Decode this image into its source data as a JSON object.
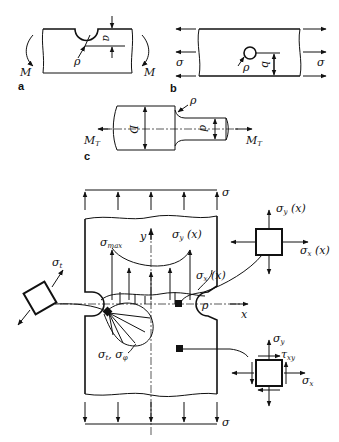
{
  "figure": {
    "panels": [
      {
        "id": "a",
        "label": "a",
        "symbols": {
          "moment_left": "M",
          "moment_right": "M",
          "radius": "ρ",
          "depth": "a"
        }
      },
      {
        "id": "b",
        "label": "b",
        "symbols": {
          "stress_left": "σ",
          "stress_right": "σ",
          "radius": "ρ",
          "distance": "b"
        }
      },
      {
        "id": "c",
        "label": "c",
        "symbols": {
          "torque_left": "M",
          "torque_left_sub": "T",
          "torque_right": "M",
          "torque_right_sub": "T",
          "radius": "ρ",
          "big_diameter": "D",
          "small_diameter": "d"
        }
      }
    ],
    "main": {
      "applied_stress_top": "σ",
      "applied_stress_bottom": "σ",
      "sigma_max": {
        "sym": "σ",
        "sub": "max"
      },
      "y_axis": "y",
      "x_axis": "x",
      "radius": "ρ",
      "sigma_y_x": {
        "sym": "σ",
        "sub": "y",
        "arg": " (x)"
      },
      "sigma_x_x": {
        "sym": "σ",
        "sub": "x",
        "arg": " (x)"
      },
      "sigma_t": {
        "sym": "σ",
        "sub": "t"
      },
      "sigma_t_phi": {
        "s1": "σ",
        "sub1": "t",
        "sep": ", ",
        "s2": "σ",
        "sub2": "φ"
      },
      "element_top_right": {
        "sy": "σ",
        "sy_sub": "y",
        "sy_arg": " (x)",
        "sx": "σ",
        "sx_sub": "x",
        "sx_arg": " (x)"
      },
      "element_bottom_right": {
        "sy": "σ",
        "sy_sub": "y",
        "tau": "τ",
        "tau_sub": "xy",
        "sx": "σ",
        "sx_sub": "x"
      }
    }
  }
}
